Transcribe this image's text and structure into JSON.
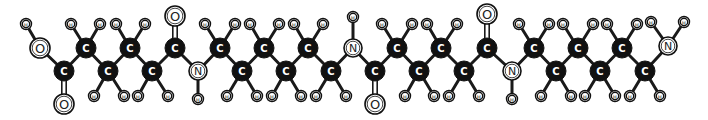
{
  "diagram": {
    "title": "",
    "type": "ball-and-stick molecular structure",
    "colors": {
      "carbon_fill": "#111111",
      "carbon_label": "#ffffff",
      "hetero_fill": "#ffffff",
      "bond": "#1a1a1a",
      "background": "#ffffff"
    },
    "atoms": [
      {
        "id": "H1",
        "el": "H",
        "x": 26,
        "y": 24
      },
      {
        "id": "O1",
        "el": "O",
        "x": 40,
        "y": 48
      },
      {
        "id": "C1",
        "el": "C",
        "x": 64,
        "y": 71
      },
      {
        "id": "O2",
        "el": "O",
        "x": 64,
        "y": 104
      },
      {
        "id": "C2",
        "el": "C",
        "x": 86,
        "y": 48
      },
      {
        "id": "H2",
        "el": "H",
        "x": 71,
        "y": 24
      },
      {
        "id": "H3",
        "el": "H",
        "x": 100,
        "y": 24
      },
      {
        "id": "C3",
        "el": "C",
        "x": 108,
        "y": 71
      },
      {
        "id": "H4",
        "el": "H",
        "x": 94,
        "y": 96
      },
      {
        "id": "H5",
        "el": "H",
        "x": 124,
        "y": 96
      },
      {
        "id": "C4",
        "el": "C",
        "x": 130,
        "y": 48
      },
      {
        "id": "H6",
        "el": "H",
        "x": 116,
        "y": 24
      },
      {
        "id": "H7",
        "el": "H",
        "x": 145,
        "y": 24
      },
      {
        "id": "C5",
        "el": "C",
        "x": 152,
        "y": 71
      },
      {
        "id": "H8",
        "el": "H",
        "x": 138,
        "y": 96
      },
      {
        "id": "H9",
        "el": "H",
        "x": 168,
        "y": 96
      },
      {
        "id": "C6",
        "el": "C",
        "x": 175,
        "y": 48
      },
      {
        "id": "O3",
        "el": "O",
        "x": 175,
        "y": 16
      },
      {
        "id": "N1",
        "el": "N",
        "x": 198,
        "y": 71
      },
      {
        "id": "H10",
        "el": "H",
        "x": 198,
        "y": 99
      },
      {
        "id": "C7",
        "el": "C",
        "x": 220,
        "y": 48
      },
      {
        "id": "H11",
        "el": "H",
        "x": 205,
        "y": 24
      },
      {
        "id": "H12",
        "el": "H",
        "x": 235,
        "y": 24
      },
      {
        "id": "C8",
        "el": "C",
        "x": 242,
        "y": 71
      },
      {
        "id": "H13",
        "el": "H",
        "x": 227,
        "y": 96
      },
      {
        "id": "H14",
        "el": "H",
        "x": 257,
        "y": 96
      },
      {
        "id": "C9",
        "el": "C",
        "x": 264,
        "y": 48
      },
      {
        "id": "H15",
        "el": "H",
        "x": 250,
        "y": 24
      },
      {
        "id": "H16",
        "el": "H",
        "x": 279,
        "y": 24
      },
      {
        "id": "C10",
        "el": "C",
        "x": 286,
        "y": 71
      },
      {
        "id": "H17",
        "el": "H",
        "x": 272,
        "y": 96
      },
      {
        "id": "H18",
        "el": "H",
        "x": 301,
        "y": 96
      },
      {
        "id": "C11",
        "el": "C",
        "x": 308,
        "y": 48
      },
      {
        "id": "H19",
        "el": "H",
        "x": 294,
        "y": 24
      },
      {
        "id": "H20",
        "el": "H",
        "x": 323,
        "y": 24
      },
      {
        "id": "C12",
        "el": "C",
        "x": 331,
        "y": 71
      },
      {
        "id": "H21",
        "el": "H",
        "x": 316,
        "y": 96
      },
      {
        "id": "H22",
        "el": "H",
        "x": 346,
        "y": 96
      },
      {
        "id": "N2",
        "el": "N",
        "x": 353,
        "y": 48
      },
      {
        "id": "H23",
        "el": "H",
        "x": 353,
        "y": 17
      },
      {
        "id": "C13",
        "el": "C",
        "x": 375,
        "y": 71
      },
      {
        "id": "O4",
        "el": "O",
        "x": 375,
        "y": 104
      },
      {
        "id": "C14",
        "el": "C",
        "x": 397,
        "y": 48
      },
      {
        "id": "H24",
        "el": "H",
        "x": 382,
        "y": 24
      },
      {
        "id": "H25",
        "el": "H",
        "x": 412,
        "y": 24
      },
      {
        "id": "C15",
        "el": "C",
        "x": 419,
        "y": 71
      },
      {
        "id": "H26",
        "el": "H",
        "x": 405,
        "y": 96
      },
      {
        "id": "H27",
        "el": "H",
        "x": 434,
        "y": 96
      },
      {
        "id": "C16",
        "el": "C",
        "x": 441,
        "y": 48
      },
      {
        "id": "H28",
        "el": "H",
        "x": 427,
        "y": 24
      },
      {
        "id": "H29",
        "el": "H",
        "x": 457,
        "y": 24
      },
      {
        "id": "C17",
        "el": "C",
        "x": 464,
        "y": 71
      },
      {
        "id": "H30",
        "el": "H",
        "x": 449,
        "y": 96
      },
      {
        "id": "H31",
        "el": "H",
        "x": 479,
        "y": 96
      },
      {
        "id": "C18",
        "el": "C",
        "x": 487,
        "y": 48
      },
      {
        "id": "O5",
        "el": "O",
        "x": 487,
        "y": 14
      },
      {
        "id": "N3",
        "el": "N",
        "x": 512,
        "y": 71
      },
      {
        "id": "H32",
        "el": "H",
        "x": 512,
        "y": 99
      },
      {
        "id": "C19",
        "el": "C",
        "x": 534,
        "y": 48
      },
      {
        "id": "H33",
        "el": "H",
        "x": 519,
        "y": 24
      },
      {
        "id": "H34",
        "el": "H",
        "x": 549,
        "y": 24
      },
      {
        "id": "C20",
        "el": "C",
        "x": 556,
        "y": 71
      },
      {
        "id": "H35",
        "el": "H",
        "x": 541,
        "y": 96
      },
      {
        "id": "H36",
        "el": "H",
        "x": 571,
        "y": 96
      },
      {
        "id": "C21",
        "el": "C",
        "x": 578,
        "y": 48
      },
      {
        "id": "H37",
        "el": "H",
        "x": 563,
        "y": 24
      },
      {
        "id": "H38",
        "el": "H",
        "x": 593,
        "y": 24
      },
      {
        "id": "C22",
        "el": "C",
        "x": 600,
        "y": 71
      },
      {
        "id": "H39",
        "el": "H",
        "x": 585,
        "y": 96
      },
      {
        "id": "H40",
        "el": "H",
        "x": 615,
        "y": 96
      },
      {
        "id": "C23",
        "el": "C",
        "x": 622,
        "y": 48
      },
      {
        "id": "H41",
        "el": "H",
        "x": 607,
        "y": 24
      },
      {
        "id": "H42",
        "el": "H",
        "x": 637,
        "y": 24
      },
      {
        "id": "C24",
        "el": "C",
        "x": 645,
        "y": 71
      },
      {
        "id": "H43",
        "el": "H",
        "x": 630,
        "y": 96
      },
      {
        "id": "H44",
        "el": "H",
        "x": 660,
        "y": 96
      },
      {
        "id": "N4",
        "el": "N",
        "x": 668,
        "y": 46
      },
      {
        "id": "H45",
        "el": "H",
        "x": 651,
        "y": 22
      },
      {
        "id": "H46",
        "el": "H",
        "x": 684,
        "y": 22
      }
    ],
    "bonds": [
      [
        "H1",
        "O1",
        1
      ],
      [
        "O1",
        "C1",
        1
      ],
      [
        "C1",
        "O2",
        2
      ],
      [
        "C1",
        "C2",
        1
      ],
      [
        "C2",
        "H2",
        1
      ],
      [
        "C2",
        "H3",
        1
      ],
      [
        "C2",
        "C3",
        1
      ],
      [
        "C3",
        "H4",
        1
      ],
      [
        "C3",
        "H5",
        1
      ],
      [
        "C3",
        "C4",
        1
      ],
      [
        "C4",
        "H6",
        1
      ],
      [
        "C4",
        "H7",
        1
      ],
      [
        "C4",
        "C5",
        1
      ],
      [
        "C5",
        "H8",
        1
      ],
      [
        "C5",
        "H9",
        1
      ],
      [
        "C5",
        "C6",
        1
      ],
      [
        "C6",
        "O3",
        2
      ],
      [
        "C6",
        "N1",
        1
      ],
      [
        "N1",
        "H10",
        1
      ],
      [
        "N1",
        "C7",
        1
      ],
      [
        "C7",
        "H11",
        1
      ],
      [
        "C7",
        "H12",
        1
      ],
      [
        "C7",
        "C8",
        1
      ],
      [
        "C8",
        "H13",
        1
      ],
      [
        "C8",
        "H14",
        1
      ],
      [
        "C8",
        "C9",
        1
      ],
      [
        "C9",
        "H15",
        1
      ],
      [
        "C9",
        "H16",
        1
      ],
      [
        "C9",
        "C10",
        1
      ],
      [
        "C10",
        "H17",
        1
      ],
      [
        "C10",
        "H18",
        1
      ],
      [
        "C10",
        "C11",
        1
      ],
      [
        "C11",
        "H19",
        1
      ],
      [
        "C11",
        "H20",
        1
      ],
      [
        "C11",
        "C12",
        1
      ],
      [
        "C12",
        "H21",
        1
      ],
      [
        "C12",
        "H22",
        1
      ],
      [
        "C12",
        "N2",
        1
      ],
      [
        "N2",
        "H23",
        1
      ],
      [
        "N2",
        "C13",
        1
      ],
      [
        "C13",
        "O4",
        2
      ],
      [
        "C13",
        "C14",
        1
      ],
      [
        "C14",
        "H24",
        1
      ],
      [
        "C14",
        "H25",
        1
      ],
      [
        "C14",
        "C15",
        1
      ],
      [
        "C15",
        "H26",
        1
      ],
      [
        "C15",
        "H27",
        1
      ],
      [
        "C15",
        "C16",
        1
      ],
      [
        "C16",
        "H28",
        1
      ],
      [
        "C16",
        "H29",
        1
      ],
      [
        "C16",
        "C17",
        1
      ],
      [
        "C17",
        "H30",
        1
      ],
      [
        "C17",
        "H31",
        1
      ],
      [
        "C17",
        "C18",
        1
      ],
      [
        "C18",
        "O5",
        2
      ],
      [
        "C18",
        "N3",
        1
      ],
      [
        "N3",
        "H32",
        1
      ],
      [
        "N3",
        "C19",
        1
      ],
      [
        "C19",
        "H33",
        1
      ],
      [
        "C19",
        "H34",
        1
      ],
      [
        "C19",
        "C20",
        1
      ],
      [
        "C20",
        "H35",
        1
      ],
      [
        "C20",
        "H36",
        1
      ],
      [
        "C20",
        "C21",
        1
      ],
      [
        "C21",
        "H37",
        1
      ],
      [
        "C21",
        "H38",
        1
      ],
      [
        "C21",
        "C22",
        1
      ],
      [
        "C22",
        "H39",
        1
      ],
      [
        "C22",
        "H40",
        1
      ],
      [
        "C22",
        "C23",
        1
      ],
      [
        "C23",
        "H41",
        1
      ],
      [
        "C23",
        "H42",
        1
      ],
      [
        "C23",
        "C24",
        1
      ],
      [
        "C24",
        "H43",
        1
      ],
      [
        "C24",
        "H44",
        1
      ],
      [
        "C24",
        "N4",
        1
      ],
      [
        "N4",
        "H45",
        1
      ],
      [
        "N4",
        "H46",
        1
      ]
    ],
    "radii": {
      "C": 10,
      "N": 9,
      "O": 10,
      "H": 5.5
    }
  }
}
